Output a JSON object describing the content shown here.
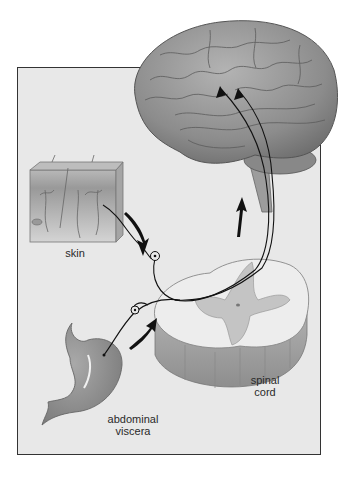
{
  "figure": {
    "structures": [
      "brain",
      "skin",
      "abdominal viscera",
      "spinal cord"
    ],
    "labels": {
      "skin": "skin",
      "spinal_cord_line1": "spinal",
      "spinal_cord_line2": "cord",
      "viscera_line1": "abdominal",
      "viscera_line2": "viscera"
    },
    "colors": {
      "frame_bg": "#e8e8e8",
      "frame_border": "#333333",
      "brain": "#8a8a8a",
      "nerve": "#111111"
    }
  }
}
